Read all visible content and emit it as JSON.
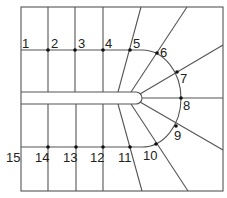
{
  "diagram": {
    "type": "winding-staircase-plan",
    "steps": [
      {
        "n": "1",
        "label_x": 22,
        "label_y": 48
      },
      {
        "n": "2",
        "label_x": 51,
        "label_y": 48
      },
      {
        "n": "3",
        "label_x": 78,
        "label_y": 48
      },
      {
        "n": "4",
        "label_x": 105,
        "label_y": 48
      },
      {
        "n": "5",
        "label_x": 133,
        "label_y": 48
      },
      {
        "n": "6",
        "label_x": 160,
        "label_y": 57
      },
      {
        "n": "7",
        "label_x": 180,
        "label_y": 83
      },
      {
        "n": "8",
        "label_x": 183,
        "label_y": 110
      },
      {
        "n": "9",
        "label_x": 174,
        "label_y": 140
      },
      {
        "n": "10",
        "label_x": 143,
        "label_y": 160
      },
      {
        "n": "11",
        "label_x": 118,
        "label_y": 162
      },
      {
        "n": "12",
        "label_x": 90,
        "label_y": 162
      },
      {
        "n": "13",
        "label_x": 63,
        "label_y": 162
      },
      {
        "n": "14",
        "label_x": 35,
        "label_y": 162
      },
      {
        "n": "15",
        "label_x": 6,
        "label_y": 162
      }
    ],
    "walking_line_points": [
      {
        "n": "2",
        "x": 48,
        "y": 50
      },
      {
        "n": "3",
        "x": 75,
        "y": 50
      },
      {
        "n": "4",
        "x": 103,
        "y": 50
      },
      {
        "n": "5",
        "x": 130,
        "y": 50
      },
      {
        "n": "6",
        "x": 157,
        "y": 53
      },
      {
        "n": "7",
        "x": 177,
        "y": 72
      },
      {
        "n": "8",
        "x": 181,
        "y": 98
      },
      {
        "n": "9",
        "x": 176,
        "y": 126
      },
      {
        "n": "10",
        "x": 156,
        "y": 144
      },
      {
        "n": "11",
        "x": 130,
        "y": 147
      },
      {
        "n": "12",
        "x": 103,
        "y": 147
      },
      {
        "n": "13",
        "x": 76,
        "y": 147
      },
      {
        "n": "14",
        "x": 48,
        "y": 147
      }
    ],
    "colors": {
      "line": "#555555",
      "text": "#222222",
      "dot": "#111111",
      "background": "#ffffff"
    }
  }
}
